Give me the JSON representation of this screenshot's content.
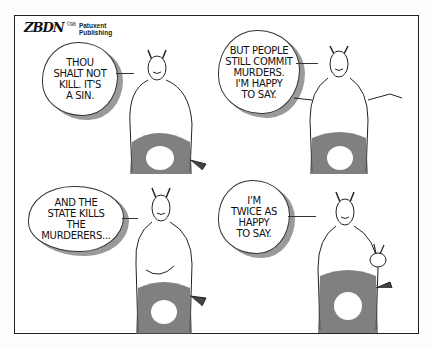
{
  "cartoon": {
    "signature": "ZBDN",
    "copyright": "©98",
    "publisher": "Patuxent\nPublishing",
    "panels": [
      {
        "id": 1,
        "position": "top-left",
        "speech": "THOU\nSHALT NOT\nKILL. IT'S\nA SIN.",
        "pose": "hands-at-sides"
      },
      {
        "id": 2,
        "position": "top-right",
        "speech": "BUT PEOPLE\nSTILL COMMIT\nMURDERS.\nI'M HAPPY\nTO SAY.",
        "pose": "shrugging"
      },
      {
        "id": 3,
        "position": "bottom-left",
        "speech": "AND THE\nSTATE KILLS\nTHE\nMURDERERS...",
        "pose": "hand-on-belly"
      },
      {
        "id": 4,
        "position": "bottom-right",
        "speech": "I'M\nTWICE AS\nHAPPY\nTO SAY.",
        "pose": "peace-sign"
      }
    ],
    "character": "horned-devil"
  }
}
